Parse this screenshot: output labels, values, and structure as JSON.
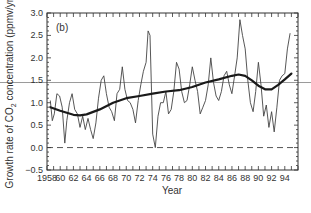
{
  "chart_data": {
    "type": "line",
    "panel_label": "(b)",
    "title": "",
    "xlabel": "Year",
    "ylabel": "Growth rate of CO2 concentration (ppmv/yr)",
    "ylabel_parts": [
      "Growth rate of CO",
      "2",
      " concentration (ppmv/yr)"
    ],
    "xlim": [
      1958,
      1996
    ],
    "ylim": [
      -0.5,
      3.0
    ],
    "x_ticks": [
      1958,
      1960,
      1962,
      1964,
      1966,
      1968,
      1970,
      1972,
      1974,
      1976,
      1978,
      1980,
      1982,
      1984,
      1986,
      1988,
      1990,
      1992,
      1994
    ],
    "x_tick_labels": [
      "1958",
      "60",
      "62",
      "64",
      "66",
      "68",
      "70",
      "72",
      "74",
      "76",
      "78",
      "80",
      "82",
      "84",
      "86",
      "88",
      "90",
      "92",
      "94"
    ],
    "y_ticks": [
      -0.5,
      0.0,
      0.5,
      1.0,
      1.5,
      2.0,
      2.5,
      3.0
    ],
    "y_tick_labels": [
      "−0.5",
      "0.0",
      "0.5",
      "1.0",
      "1.5",
      "2.0",
      "2.5",
      "3.0"
    ],
    "reference_lines": [
      {
        "name": "zero-line",
        "y": 0.0,
        "style": "dashed"
      },
      {
        "name": "horizontal-reference-line",
        "y": 1.45,
        "style": "solid-gray",
        "extends_beyond_axes": true
      }
    ],
    "grid": false,
    "legend": null,
    "series": [
      {
        "name": "annual growth rate",
        "style": "thin",
        "x": [
          1958.5,
          1958.8,
          1959.1,
          1959.5,
          1959.9,
          1960.3,
          1960.7,
          1961.0,
          1961.4,
          1961.8,
          1962.2,
          1962.6,
          1963.0,
          1963.4,
          1963.8,
          1964.2,
          1964.6,
          1965.0,
          1965.4,
          1965.8,
          1966.2,
          1966.6,
          1967.0,
          1967.4,
          1967.8,
          1968.2,
          1968.6,
          1969.0,
          1969.4,
          1969.8,
          1970.2,
          1970.6,
          1971.0,
          1971.4,
          1971.8,
          1972.2,
          1972.6,
          1973.0,
          1973.3,
          1973.6,
          1974.0,
          1974.4,
          1974.8,
          1975.2,
          1975.6,
          1976.0,
          1976.4,
          1976.8,
          1977.2,
          1977.6,
          1978.0,
          1978.4,
          1978.8,
          1979.2,
          1979.6,
          1980.0,
          1980.4,
          1980.8,
          1981.2,
          1981.6,
          1982.0,
          1982.4,
          1982.8,
          1983.2,
          1983.6,
          1984.0,
          1984.4,
          1984.8,
          1985.2,
          1985.6,
          1986.0,
          1986.4,
          1986.8,
          1987.2,
          1987.6,
          1988.0,
          1988.4,
          1988.8,
          1989.2,
          1989.6,
          1990.0,
          1990.4,
          1990.8,
          1991.2,
          1991.6,
          1992.0,
          1992.4,
          1992.8,
          1993.2,
          1993.6,
          1994.0,
          1994.4,
          1994.8
        ],
        "values": [
          1.05,
          0.6,
          0.75,
          1.2,
          1.15,
          0.9,
          0.1,
          0.6,
          1.0,
          1.2,
          0.85,
          0.75,
          0.45,
          0.7,
          0.4,
          0.65,
          0.4,
          0.2,
          0.55,
          1.1,
          1.5,
          1.6,
          1.2,
          0.9,
          0.8,
          0.6,
          1.2,
          1.3,
          1.8,
          1.3,
          1.05,
          1.0,
          0.85,
          0.55,
          1.05,
          1.4,
          1.7,
          1.9,
          2.6,
          2.5,
          0.3,
          0.0,
          0.7,
          1.0,
          1.0,
          1.25,
          0.75,
          0.85,
          1.25,
          1.9,
          1.75,
          1.25,
          1.0,
          1.05,
          1.4,
          1.8,
          1.5,
          1.25,
          0.75,
          0.9,
          1.05,
          1.4,
          2.0,
          1.45,
          1.15,
          1.05,
          1.25,
          1.6,
          1.7,
          1.4,
          1.2,
          1.6,
          2.0,
          2.85,
          2.5,
          2.2,
          1.5,
          1.0,
          0.8,
          1.25,
          1.9,
          1.4,
          0.7,
          0.95,
          0.45,
          0.8,
          0.35,
          0.9,
          1.5,
          1.6,
          1.65,
          2.2,
          2.55
        ]
      },
      {
        "name": "smoothed trend",
        "style": "thick",
        "x": [
          1958.5,
          1960,
          1962,
          1963,
          1964,
          1966,
          1968,
          1970,
          1972,
          1974,
          1976,
          1978,
          1980,
          1982,
          1984,
          1986,
          1987,
          1988,
          1989,
          1990,
          1991,
          1992,
          1993,
          1994,
          1995
        ],
        "values": [
          0.9,
          0.82,
          0.73,
          0.72,
          0.74,
          0.85,
          1.0,
          1.1,
          1.15,
          1.2,
          1.25,
          1.28,
          1.35,
          1.45,
          1.52,
          1.6,
          1.63,
          1.6,
          1.5,
          1.38,
          1.3,
          1.3,
          1.4,
          1.52,
          1.65
        ]
      }
    ]
  }
}
